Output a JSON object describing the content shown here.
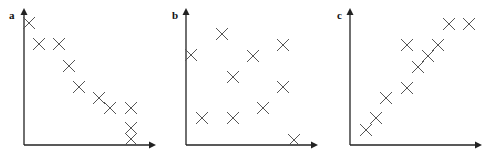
{
  "chart_data": [
    {
      "type": "scatter",
      "panel_label": "a",
      "title": "",
      "xlabel": "",
      "ylabel": "",
      "grid": false,
      "legend": null,
      "description": "negative correlation",
      "axis_origin": [
        24,
        145
      ],
      "axis_x_end": 156,
      "axis_y_end": 8,
      "points_px": [
        [
          29,
          23
        ],
        [
          39,
          44
        ],
        [
          59,
          44
        ],
        [
          69,
          66
        ],
        [
          79,
          87
        ],
        [
          99,
          98
        ],
        [
          110,
          108
        ],
        [
          131,
          108
        ],
        [
          131,
          128
        ],
        [
          131,
          139
        ]
      ],
      "points": [
        [
          0.04,
          0.89
        ],
        [
          0.11,
          0.74
        ],
        [
          0.26,
          0.74
        ],
        [
          0.34,
          0.58
        ],
        [
          0.42,
          0.42
        ],
        [
          0.57,
          0.34
        ],
        [
          0.65,
          0.27
        ],
        [
          0.81,
          0.27
        ],
        [
          0.81,
          0.12
        ],
        [
          0.81,
          0.04
        ]
      ]
    },
    {
      "type": "scatter",
      "panel_label": "b",
      "title": "",
      "xlabel": "",
      "ylabel": "",
      "grid": false,
      "legend": null,
      "description": "no correlation",
      "axis_origin": [
        186,
        145
      ],
      "axis_x_end": 318,
      "axis_y_end": 8,
      "points_px": [
        [
          191,
          55
        ],
        [
          222,
          34
        ],
        [
          233,
          77
        ],
        [
          253,
          56
        ],
        [
          283,
          45
        ],
        [
          283,
          87
        ],
        [
          263,
          108
        ],
        [
          202,
          118
        ],
        [
          233,
          118
        ],
        [
          294,
          140
        ]
      ],
      "points": [
        [
          0.04,
          0.66
        ],
        [
          0.27,
          0.81
        ],
        [
          0.36,
          0.5
        ],
        [
          0.51,
          0.65
        ],
        [
          0.73,
          0.73
        ],
        [
          0.73,
          0.42
        ],
        [
          0.58,
          0.27
        ],
        [
          0.12,
          0.2
        ],
        [
          0.36,
          0.2
        ],
        [
          0.82,
          0.04
        ]
      ]
    },
    {
      "type": "scatter",
      "panel_label": "c",
      "title": "",
      "xlabel": "",
      "ylabel": "",
      "grid": false,
      "legend": null,
      "description": "positive correlation",
      "axis_origin": [
        350,
        145
      ],
      "axis_x_end": 482,
      "axis_y_end": 8,
      "points_px": [
        [
          366,
          130
        ],
        [
          376,
          118
        ],
        [
          386,
          98
        ],
        [
          407,
          88
        ],
        [
          418,
          67
        ],
        [
          428,
          56
        ],
        [
          438,
          45
        ],
        [
          407,
          45
        ],
        [
          449,
          24
        ],
        [
          469,
          24
        ]
      ],
      "points": [
        [
          0.12,
          0.11
        ],
        [
          0.2,
          0.2
        ],
        [
          0.27,
          0.34
        ],
        [
          0.43,
          0.42
        ],
        [
          0.51,
          0.57
        ],
        [
          0.59,
          0.65
        ],
        [
          0.66,
          0.73
        ],
        [
          0.43,
          0.73
        ],
        [
          0.75,
          0.88
        ],
        [
          0.9,
          0.88
        ]
      ]
    }
  ],
  "style": {
    "axis_color": "#222222",
    "marker_color": "#555555",
    "marker_size": 12
  }
}
